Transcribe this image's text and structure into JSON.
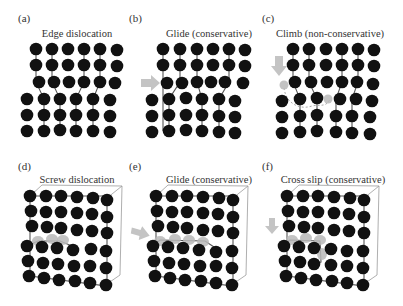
{
  "figure": {
    "panels": [
      {
        "id": "a",
        "letter": "(a)",
        "title": "Edge dislocation"
      },
      {
        "id": "b",
        "letter": "(b)",
        "title": "Glide (conservative)"
      },
      {
        "id": "c",
        "letter": "(c)",
        "title": "Climb (non-conservative)"
      },
      {
        "id": "d",
        "letter": "(d)",
        "title": "Screw dislocation"
      },
      {
        "id": "e",
        "letter": "(e)",
        "title": "Glide (conservative)"
      },
      {
        "id": "f",
        "letter": "(f)",
        "title": "Cross slip (conservative)"
      }
    ],
    "colors": {
      "atom": "#111111",
      "bond": "#555555",
      "ghost_atom": "#b9b9b9",
      "arrow": "#c4c4c4",
      "cube_edge": "#9a9a9a"
    }
  }
}
